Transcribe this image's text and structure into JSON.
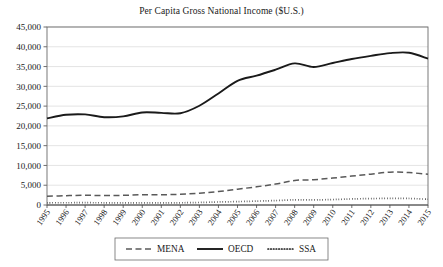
{
  "chart_data": {
    "type": "line",
    "title": "Per Capita Gross National Income ($U.S.)",
    "xlabel": "",
    "ylabel": "",
    "ylim": [
      0,
      45000
    ],
    "xlim": [
      "1995",
      "2015"
    ],
    "grid": true,
    "legend_position": "bottom",
    "y_ticks": [
      "0",
      "5,000",
      "10,000",
      "15,000",
      "20,000",
      "25,000",
      "30,000",
      "35,000",
      "40,000",
      "45,000"
    ],
    "y_tick_values": [
      0,
      5000,
      10000,
      15000,
      20000,
      25000,
      30000,
      35000,
      40000,
      45000
    ],
    "categories": [
      "1995",
      "1996",
      "1997",
      "1998",
      "1999",
      "2000",
      "2001",
      "2002",
      "2003",
      "2004",
      "2005",
      "2006",
      "2007",
      "2008",
      "2009",
      "2010",
      "2011",
      "2012",
      "2013",
      "2014",
      "2015"
    ],
    "series": [
      {
        "name": "MENA",
        "style": "dashed",
        "color": "#595959",
        "values": [
          2200,
          2350,
          2450,
          2400,
          2450,
          2600,
          2600,
          2700,
          3000,
          3400,
          4000,
          4600,
          5300,
          6200,
          6400,
          6800,
          7300,
          7800,
          8300,
          8200,
          7750
        ]
      },
      {
        "name": "OECD",
        "style": "solid",
        "color": "#1a1a1a",
        "values": [
          21900,
          22800,
          22900,
          22200,
          22400,
          23400,
          23300,
          23200,
          25100,
          28200,
          31400,
          32700,
          34200,
          35800,
          34900,
          35900,
          36900,
          37700,
          38400,
          38500,
          37000
        ]
      },
      {
        "name": "SSA",
        "style": "dotted",
        "color": "#1a1a1a",
        "values": [
          560,
          570,
          580,
          560,
          540,
          550,
          540,
          560,
          640,
          760,
          860,
          980,
          1120,
          1300,
          1280,
          1380,
          1530,
          1620,
          1670,
          1650,
          1450
        ]
      }
    ]
  },
  "legend": {
    "items": [
      {
        "label": "MENA",
        "style": "dashed"
      },
      {
        "label": "OECD",
        "style": "solid"
      },
      {
        "label": "SSA",
        "style": "dotted"
      }
    ]
  }
}
